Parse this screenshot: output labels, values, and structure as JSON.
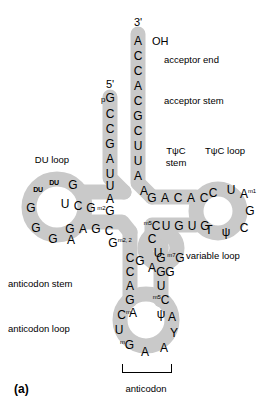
{
  "figure": {
    "panel_label": "(a)"
  },
  "termini": {
    "five_prime": "5'",
    "three_prime": "3'",
    "hydroxyl": "OH"
  },
  "region_labels": {
    "acceptor_end": "acceptor end",
    "acceptor_stem": "acceptor stem",
    "du_loop": "DU loop",
    "tpsic_stem": "TψC\nstem",
    "tpsic_stem_line1": "TψC",
    "tpsic_stem_line2": "stem",
    "tpsic_loop": "TψC loop",
    "variable_loop": "variable loop",
    "anticodon_stem": "anticodon stem",
    "anticodon_loop": "anticodon loop",
    "anticodon": "anticodon"
  },
  "sequence": {
    "acceptor_3p_strand": [
      "A",
      "C",
      "C",
      "A",
      "C",
      "G",
      "C",
      "U",
      "U",
      "A",
      "A"
    ],
    "acceptor_5p_strand": [
      "pG",
      "C",
      "C",
      "G",
      "A",
      "U",
      "U",
      "A"
    ],
    "acceptor_5p_terminal_phosphate": "p",
    "du_stem_upper": [
      "C",
      "U",
      "C",
      "G"
    ],
    "du_stem_lower": [
      "G",
      "A",
      "G",
      "C"
    ],
    "du_stem_upper_modified": "m2G",
    "du_stem_lower_modified": "m2,2G",
    "du_loop_bases": [
      "DU",
      "DU",
      "G",
      "G",
      "G",
      "G",
      "A"
    ],
    "tpsic_stem_upper": [
      "G",
      "A",
      "C",
      "A",
      "C"
    ],
    "tpsic_stem_lower": [
      "C",
      "U",
      "G",
      "U",
      "G"
    ],
    "tpsic_stem_lower_modified": "m5C",
    "tpsic_loop_bases": [
      "C",
      "U",
      "A",
      "G",
      "C",
      "ψ",
      "T"
    ],
    "tpsic_loop_modified": "m1A",
    "variable_loop_bases": [
      "C",
      "U",
      "G",
      "G",
      "A",
      "G"
    ],
    "variable_loop_modified": "m7G",
    "anticodon_stem_left": [
      "C",
      "C",
      "A",
      "G",
      "A"
    ],
    "anticodon_stem_right": [
      "G",
      "G",
      "U",
      "C",
      "ψ"
    ],
    "anticodon_stem_right_modified": "m5C",
    "anticodon_loop_bases": [
      "C",
      "U",
      "G",
      "A",
      "A",
      "A",
      "Y",
      "A"
    ],
    "anticodon_loop_modified_cm": "Cm",
    "anticodon_loop_modified_mg": "mG",
    "anticodon_triplet": [
      "G",
      "A",
      "A"
    ]
  },
  "colors": {
    "ribbon": "#c9c9c9",
    "ribbon_stroke": "#b4b4b4",
    "text": "#000000",
    "background": "#ffffff"
  }
}
